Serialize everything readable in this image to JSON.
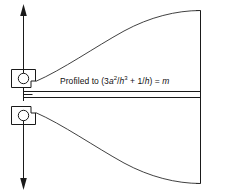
{
  "figure": {
    "width": 246,
    "height": 194,
    "background_color": "#ffffff",
    "line_color": "#1a1a1a"
  },
  "annotation": {
    "text_full": "Profiled to (3a2/h3 + 1/h) = m",
    "prefix": "Profiled to (3",
    "var_a": "a",
    "exp_a": "2",
    "slash1": "/",
    "var_h1": "h",
    "exp_h": "3",
    "plus": " + 1/",
    "var_h2": "h",
    "close_eq": ") = ",
    "var_m": "m"
  },
  "parts": {
    "upper_pivot_label": "upper pivot circle",
    "lower_pivot_label": "lower pivot circle",
    "upper_block_label": "upper support block",
    "lower_block_label": "lower support block",
    "up_arrow_label": "upward load arrow",
    "down_arrow_label": "downward load arrow",
    "fixed_support_label": "fixed end support",
    "upper_profile_label": "upper profiled edge",
    "lower_profile_label": "lower profiled edge",
    "right_edge_label": "right end face"
  }
}
